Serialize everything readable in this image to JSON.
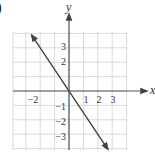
{
  "corner_mark": ")",
  "chart_data": {
    "type": "line",
    "title": "",
    "xlabel": "x",
    "ylabel": "y",
    "xlim": [
      -4,
      4
    ],
    "ylim": [
      -4,
      4
    ],
    "grid": true,
    "x_tick_labels": [
      "-2",
      "1",
      "2",
      "3"
    ],
    "y_tick_labels": [
      "3",
      "2",
      "-1",
      "-2",
      "-3"
    ],
    "series": [
      {
        "name": "line",
        "equation": "y = -1.5x",
        "x": [
          -2.6,
          0,
          2.7
        ],
        "y": [
          3.9,
          0,
          -4.05
        ],
        "arrows": "both"
      }
    ],
    "colors": {
      "grid": "#d9d9d9",
      "axis": "#555555",
      "line": "#444444"
    }
  }
}
